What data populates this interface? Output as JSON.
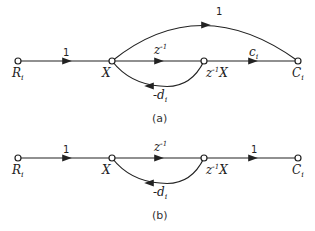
{
  "diagram_a": {
    "caption": "(a)",
    "nodes": {
      "input": "R",
      "input_sub": "i",
      "x": "X",
      "delayed": "z",
      "delayed_exp": "-1",
      "delayed_var": "X",
      "output": "C",
      "output_sub": "i"
    },
    "edges": {
      "input_gain": "1",
      "delay_gain": "z",
      "delay_exp": "-1",
      "output_gain": "c",
      "output_gain_sub": "i",
      "feedback_gain": "-d",
      "feedback_sub": "i",
      "feedforward_gain": "1"
    }
  },
  "diagram_b": {
    "caption": "(b)",
    "nodes": {
      "input": "R",
      "input_sub": "i",
      "x": "X",
      "delayed": "z",
      "delayed_exp": "-1",
      "delayed_var": "X",
      "output": "C",
      "output_sub": "i"
    },
    "edges": {
      "input_gain": "1",
      "delay_gain": "z",
      "delay_exp": "-1",
      "output_gain": "1",
      "feedback_gain": "-d",
      "feedback_sub": "i"
    }
  }
}
